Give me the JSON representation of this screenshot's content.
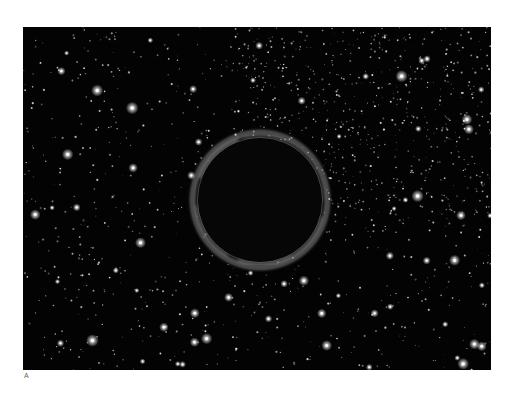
{
  "figure": {
    "panel_label": "A",
    "background_color": "#030303",
    "frame": {
      "x": 23,
      "y": 27,
      "width": 468,
      "height": 343
    },
    "black_hole": {
      "center_x": 237,
      "center_y": 173,
      "radius": 62,
      "disk_color": "#060606",
      "rim_color": "#9a9a9a"
    },
    "stars": {
      "count": 1400,
      "bright_count": 70,
      "seed": 20231,
      "color": "#ffffff"
    }
  }
}
